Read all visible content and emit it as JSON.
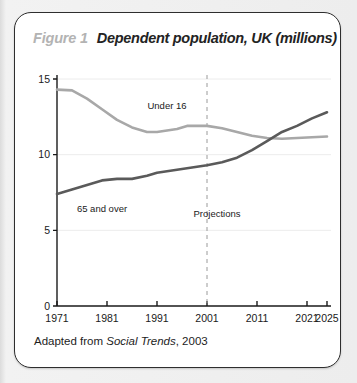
{
  "figure": {
    "label": "Figure 1",
    "title": "Dependent population, UK (millions)",
    "source_prefix": "Adapted from ",
    "source_italic": "Social Trends",
    "source_suffix": ", 2003"
  },
  "colors": {
    "under16_line": "#a8a8a8",
    "over65_line": "#5a5a5a",
    "axis": "#1a1a1a",
    "gridline": "#ececec",
    "projection_divider": "#9a9a9a",
    "box_border": "#2e2e2e",
    "figure_label": "#b3b3b3",
    "page_background": "#e8e8e8"
  },
  "chart_data": {
    "type": "line",
    "title": "Dependent population, UK (millions)",
    "xlabel": "",
    "ylabel": "",
    "xlim": [
      1971,
      2025
    ],
    "ylim": [
      0,
      15
    ],
    "yticks": [
      0,
      5,
      10,
      15
    ],
    "ytick_labels": [
      "0",
      "5",
      "10",
      "15"
    ],
    "xticks": [
      1971,
      1981,
      1991,
      2001,
      2011,
      2021,
      2025
    ],
    "xtick_labels": [
      "1971",
      "1981",
      "1991",
      "2001",
      "2011",
      "2021",
      "2025"
    ],
    "grid": true,
    "legend": "inline-labels",
    "annotations": [
      {
        "text": "Under 16",
        "x": 1993,
        "y": 13.0
      },
      {
        "text": "65 and over",
        "x": 1980,
        "y": 6.2
      },
      {
        "text": "Projections",
        "x": 2003,
        "y": 5.9
      }
    ],
    "vertical_divider": {
      "x": 2001,
      "style": "dashed",
      "label": "Projections"
    },
    "series": [
      {
        "name": "Under 16",
        "color": "#a8a8a8",
        "x": [
          1971,
          1974,
          1977,
          1980,
          1983,
          1986,
          1989,
          1991,
          1993,
          1995,
          1997,
          1999,
          2001,
          2004,
          2007,
          2010,
          2013,
          2016,
          2019,
          2022,
          2025
        ],
        "values": [
          14.3,
          14.25,
          13.7,
          13.0,
          12.3,
          11.8,
          11.5,
          11.5,
          11.6,
          11.7,
          11.9,
          11.9,
          11.9,
          11.75,
          11.5,
          11.25,
          11.1,
          11.05,
          11.1,
          11.15,
          11.2
        ]
      },
      {
        "name": "65 and over",
        "color": "#5a5a5a",
        "x": [
          1971,
          1974,
          1977,
          1980,
          1983,
          1986,
          1989,
          1991,
          1993,
          1995,
          1997,
          1999,
          2001,
          2004,
          2007,
          2010,
          2013,
          2016,
          2019,
          2022,
          2025
        ],
        "values": [
          7.4,
          7.7,
          8.0,
          8.3,
          8.4,
          8.4,
          8.6,
          8.8,
          8.9,
          9.0,
          9.1,
          9.2,
          9.3,
          9.5,
          9.8,
          10.3,
          10.9,
          11.5,
          11.9,
          12.4,
          12.8
        ]
      }
    ]
  }
}
